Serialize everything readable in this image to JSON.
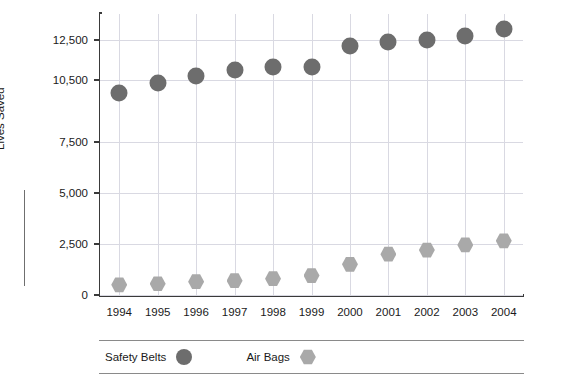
{
  "chart_data": {
    "type": "scatter",
    "title": "",
    "xlabel": "",
    "ylabel": "Lives Saved",
    "categories": [
      "1994",
      "1995",
      "1996",
      "1997",
      "1998",
      "1999",
      "2000",
      "2001",
      "2002",
      "2003",
      "2004"
    ],
    "ylim": [
      0,
      13750
    ],
    "yticks": [
      0,
      2500,
      5000,
      7500,
      10500,
      12500
    ],
    "ytick_labels": [
      "0",
      "2,500",
      "5,000",
      "7,500",
      "10,500",
      "12,500"
    ],
    "grid": true,
    "legend_position": "bottom",
    "series": [
      {
        "name": "Safety Belts",
        "marker": "circle",
        "color": "#6d6d6d",
        "values": [
          9900,
          10350,
          10700,
          11000,
          11150,
          11150,
          12200,
          12400,
          12500,
          12650,
          13000
        ]
      },
      {
        "name": "Air Bags",
        "marker": "hexagon",
        "color": "#a9a9a9",
        "values": [
          500,
          550,
          650,
          700,
          800,
          950,
          1500,
          2000,
          2200,
          2450,
          2650
        ]
      }
    ]
  },
  "legend": {
    "items": [
      {
        "label": "Safety Belts",
        "marker": "circle-marker"
      },
      {
        "label": "Air Bags",
        "marker": "hexagon-marker"
      }
    ]
  },
  "axis": {
    "y_title": "Lives Saved"
  }
}
